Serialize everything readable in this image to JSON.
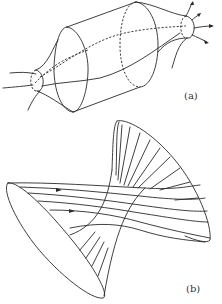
{
  "figure": {
    "panels": [
      {
        "id": "a",
        "label": "(a)",
        "description": "Flux tube: narrow ends flaring into a wide cylindrical section with field lines passing through, arrows at right end"
      },
      {
        "id": "b",
        "label": "(b)",
        "description": "Twisted hyperboloid-like surface with field lines running across, arrows on lines near left rim"
      }
    ],
    "colors": {
      "line": "#2a2a2a",
      "background": "#ffffff"
    }
  }
}
